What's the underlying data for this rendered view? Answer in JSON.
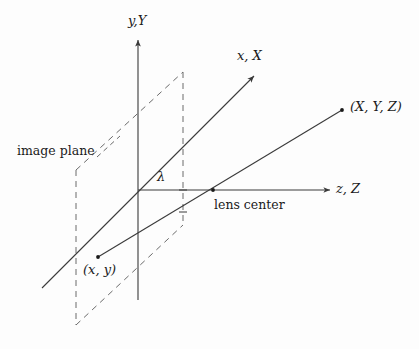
{
  "figure": {
    "background_color": "#fdfdfd",
    "stroke_color": "#3a3a3a",
    "dash_color": "#6b6b6b",
    "width": 419,
    "height": 349
  },
  "labels": {
    "y_axis": "y,Y",
    "x_axis": "x, X",
    "z_axis": "z, Z",
    "point_world": "(X, Y, Z)",
    "point_image": "(x, y)",
    "focal_length": "λ",
    "image_plane": "image plane",
    "lens_center": "lens center"
  },
  "geometry": {
    "origin": {
      "x": 138,
      "y": 190
    },
    "lens_center_point": {
      "x": 213,
      "y": 190
    },
    "image_point": {
      "x": 98,
      "y": 257
    },
    "world_point": {
      "x": 342,
      "y": 110
    },
    "y_axis": {
      "x1": 138,
      "y1": 300,
      "x2": 138,
      "y2": 38
    },
    "z_axis": {
      "x1": 138,
      "y1": 190,
      "x2": 332,
      "y2": 190
    },
    "x_axis": {
      "x1": 42,
      "y1": 288,
      "x2": 256,
      "y2": 74
    },
    "projection_ray": {
      "x1": 98,
      "y1": 257,
      "x2": 342,
      "y2": 110
    },
    "image_plane_polygon": [
      {
        "x": 76,
        "y": 170
      },
      {
        "x": 183,
        "y": 72
      },
      {
        "x": 183,
        "y": 225
      },
      {
        "x": 76,
        "y": 325
      }
    ],
    "tick_marks": [
      {
        "x": 183,
        "y": 190
      },
      {
        "x": 183,
        "y": 212
      }
    ]
  }
}
